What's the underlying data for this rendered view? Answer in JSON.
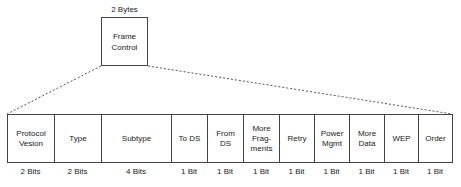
{
  "header": {
    "size_label": "2 Bytes",
    "field_label": "Frame\nControl"
  },
  "fields": [
    {
      "label": "Protocol\nVesion",
      "size": "2 Bits",
      "width": 47
    },
    {
      "label": "Type",
      "size": "2 Bits",
      "width": 47
    },
    {
      "label": "Subtype",
      "size": "4 Bits",
      "width": 70
    },
    {
      "label": "To DS",
      "size": "1 Bit",
      "width": 36
    },
    {
      "label": "From\nDS",
      "size": "1 Bit",
      "width": 36
    },
    {
      "label": "More\nFrag-\nments",
      "size": "1 Bit",
      "width": 36
    },
    {
      "label": "Retry",
      "size": "1 Bit",
      "width": 35
    },
    {
      "label": "Power\nMgmt",
      "size": "1 Bit",
      "width": 35
    },
    {
      "label": "More\nData",
      "size": "1 Bit",
      "width": 35
    },
    {
      "label": "WEP",
      "size": "1 Bit",
      "width": 34
    },
    {
      "label": "Order",
      "size": "1 Bit",
      "width": 34
    }
  ],
  "colors": {
    "line": "#444444",
    "text": "#222222"
  }
}
